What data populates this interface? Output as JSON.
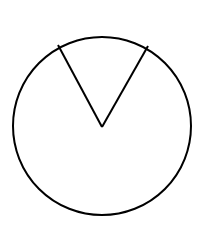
{
  "diagram": {
    "type": "circle-with-sector",
    "circle": {
      "cx": 102,
      "cy": 126,
      "r": 89
    },
    "sector": {
      "apex": {
        "x": 102,
        "y": 127
      },
      "left_end": {
        "x": 58,
        "y": 45
      },
      "right_end": {
        "x": 148,
        "y": 46
      }
    },
    "stroke_color": "#000000",
    "background_color": "#ffffff"
  }
}
